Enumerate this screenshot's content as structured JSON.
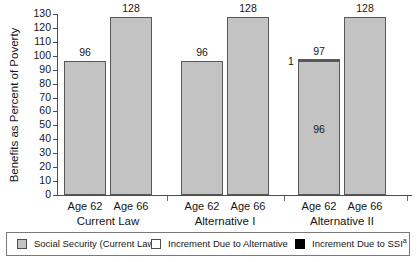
{
  "chart_data": {
    "type": "bar",
    "title": "",
    "subtitle": "",
    "xlabel": "",
    "ylabel": "Benefits as Percent of Poverty",
    "ylim": [
      0,
      130
    ],
    "ytick_step": 10,
    "yticks": [
      130,
      120,
      110,
      100,
      90,
      80,
      70,
      60,
      50,
      40,
      30,
      20,
      10,
      0
    ],
    "grid": false,
    "legend_position": "bottom",
    "stacked": true,
    "groups": [
      {
        "name": "Current Law",
        "categories": [
          "Age 62",
          "Age 66"
        ],
        "bars": [
          {
            "category": "Age 62",
            "total": 96,
            "total_label": "96",
            "segments": [
              {
                "series": "Social Security (Current Law)",
                "value": 96,
                "label": "",
                "color": "#c3c3c3"
              }
            ]
          },
          {
            "category": "Age 66",
            "total": 128,
            "total_label": "128",
            "segments": [
              {
                "series": "Social Security (Current Law)",
                "value": 128,
                "label": "",
                "color": "#c3c3c3"
              }
            ]
          }
        ]
      },
      {
        "name": "Alternative I",
        "categories": [
          "Age 62",
          "Age 66"
        ],
        "bars": [
          {
            "category": "Age 62",
            "total": 96,
            "total_label": "96",
            "segments": [
              {
                "series": "Social Security (Current Law)",
                "value": 96,
                "label": "",
                "color": "#c3c3c3"
              }
            ]
          },
          {
            "category": "Age 66",
            "total": 128,
            "total_label": "128",
            "segments": [
              {
                "series": "Social Security (Current Law)",
                "value": 128,
                "label": "",
                "color": "#c3c3c3"
              }
            ]
          }
        ]
      },
      {
        "name": "Alternative II",
        "categories": [
          "Age 62",
          "Age 66"
        ],
        "bars": [
          {
            "category": "Age 62",
            "total": 97,
            "total_label": "97",
            "segments": [
              {
                "series": "Social Security (Current Law)",
                "value": 96,
                "label": "96",
                "color": "#c3c3c3"
              },
              {
                "series": "Increment Due to Alternative",
                "value": 1,
                "label": "1",
                "color": "#ffffff"
              }
            ]
          },
          {
            "category": "Age 66",
            "total": 128,
            "total_label": "128",
            "segments": [
              {
                "series": "Social Security (Current Law)",
                "value": 128,
                "label": "",
                "color": "#c3c3c3"
              }
            ]
          }
        ]
      }
    ],
    "series": [
      {
        "name": "Social Security (Current Law)",
        "values": [
          96,
          128,
          96,
          128,
          96,
          128
        ],
        "color": "#c3c3c3"
      },
      {
        "name": "Increment Due to Alternative",
        "values": [
          0,
          0,
          0,
          0,
          1,
          0
        ],
        "color": "#ffffff"
      },
      {
        "name": "Increment Due to SSI",
        "values": [
          0,
          0,
          0,
          0,
          0,
          0
        ],
        "color": "#000000"
      }
    ],
    "categories": [
      "Current Law / Age 62",
      "Current Law / Age 66",
      "Alternative I / Age 62",
      "Alternative I / Age 66",
      "Alternative II / Age 62",
      "Alternative II / Age 66"
    ],
    "legend": [
      {
        "label": "Social Security (Current Law)",
        "color": "#c3c3c3",
        "swatch": "gray"
      },
      {
        "label": "Increment Due to Alternative",
        "color": "#ffffff",
        "swatch": "white"
      },
      {
        "label": "Increment Due to SSI",
        "footnote": "a",
        "color": "#000000",
        "swatch": "black"
      }
    ]
  }
}
